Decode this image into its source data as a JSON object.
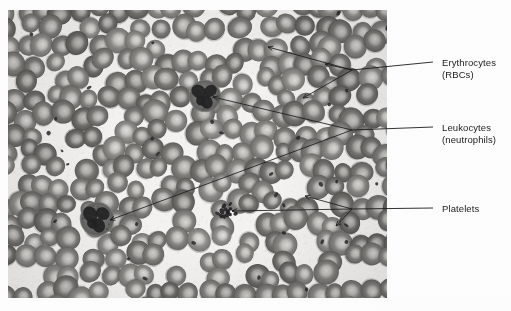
{
  "figure": {
    "type": "light-micrograph",
    "stain_tone": "grayscale",
    "background_color": "#fdfdfd",
    "plate_color": "#f2f0ee",
    "leader_color": "#1b1b1b"
  },
  "labels": [
    {
      "id": "erythrocytes",
      "line1": "Erythrocytes",
      "line2": "(RBCs)",
      "dash_x": 433,
      "dash_y": 62,
      "hub": [
        352,
        70
      ],
      "targets": [
        [
          268,
          47
        ],
        [
          325,
          64
        ],
        [
          303,
          98
        ]
      ]
    },
    {
      "id": "leukocytes",
      "line1": "Leukocytes",
      "line2": "(neutrophils)",
      "dash_x": 433,
      "dash_y": 127,
      "hub": [
        352,
        130
      ],
      "targets": [
        [
          213,
          97
        ],
        [
          110,
          220
        ]
      ]
    },
    {
      "id": "platelets",
      "line1": "Platelets",
      "line2": "",
      "dash_x": 433,
      "dash_y": 208,
      "hub": [
        352,
        209
      ],
      "targets": [
        [
          305,
          196
        ],
        [
          232,
          211
        ],
        [
          336,
          226
        ]
      ]
    }
  ],
  "micrograph": {
    "x": 8,
    "y": 10,
    "width": 379,
    "height": 288,
    "erythrocyte_count": 300,
    "erythrocyte_fill": "#8d8d8d",
    "erythrocyte_center": "#cfcfcf",
    "leukocytes": [
      {
        "cx": 205,
        "cy": 96,
        "r": 15
      },
      {
        "cx": 97,
        "cy": 219,
        "r": 16
      }
    ],
    "platelet_clusters": [
      {
        "cx": 228,
        "cy": 212,
        "n": 12
      }
    ],
    "platelet_specks": 34
  }
}
